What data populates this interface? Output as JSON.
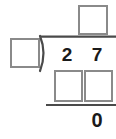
{
  "problem": {
    "type": "long-division",
    "dividend": "27",
    "dividend_digits": [
      "2",
      "7"
    ],
    "divisor": "",
    "quotient": "",
    "partial_product_digits": [
      "",
      ""
    ],
    "remainder": "0",
    "icons": {
      "division_bracket": "division-bracket-icon"
    },
    "colors": {
      "box_border": "#8a8a8a",
      "rule": "#4a4a4a",
      "digit": "#1a1a1a",
      "background": "#ffffff"
    }
  }
}
